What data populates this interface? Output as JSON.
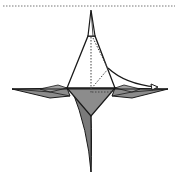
{
  "diagram": {
    "type": "origami-fold-step",
    "colors": {
      "background": "#ffffff",
      "outline": "#1a1a1a",
      "paper_front": "#ffffff",
      "paper_back": "#8c8c8c",
      "paper_back_dark": "#6e6e6e",
      "dotted_line": "#555555"
    },
    "elements": {
      "top_border": "dotted separator line",
      "top_spike": "narrow top point",
      "upper_triangle": "white front flap",
      "left_flap": "horizontal left point",
      "right_flap": "horizontal right point",
      "lower_kite": "gray back layer",
      "bottom_spike": "long curved lower point",
      "valley_fold_lines": "dotted crease lines",
      "fold_arrow": "curved arrow pointing right"
    }
  }
}
